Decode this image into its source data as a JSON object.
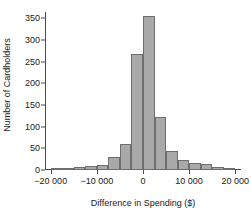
{
  "chart_data": {
    "type": "bar",
    "title": "",
    "xlabel": "Difference in Spending ($)",
    "ylabel": "Number of Cardholders",
    "grid": false,
    "legend": false,
    "xlim": [
      -21250,
      21250
    ],
    "ylim": [
      0,
      365
    ],
    "bin_width": 2500,
    "xticks": [
      -20000,
      -10000,
      0,
      10000,
      20000
    ],
    "xtick_labels": [
      "−20 000",
      "−10 000",
      "0",
      "10 000",
      "20 000"
    ],
    "yticks": [
      0,
      50,
      100,
      150,
      200,
      250,
      300,
      350
    ],
    "ytick_labels": [
      "0",
      "50",
      "100",
      "150",
      "200",
      "250",
      "300",
      "350"
    ],
    "categories": [
      "-20000 to -17500",
      "-17500 to -15000",
      "-15000 to -12500",
      "-12500 to -10000",
      "-10000 to -7500",
      "-7500 to -5000",
      "-5000 to -2500",
      "-2500 to 0",
      "0 to 2500",
      "2500 to 5000",
      "5000 to 7500",
      "7500 to 10000",
      "10000 to 12500",
      "12500 to 15000",
      "15000 to 17500",
      "17500 to 20000"
    ],
    "bin_starts": [
      -20000,
      -17500,
      -15000,
      -12500,
      -10000,
      -7500,
      -5000,
      -2500,
      0,
      2500,
      5000,
      7500,
      10000,
      12500,
      15000,
      17500
    ],
    "values": [
      2,
      3,
      8,
      10,
      11,
      29,
      59,
      268,
      355,
      122,
      43,
      24,
      17,
      13,
      8,
      5
    ],
    "series": [
      {
        "name": "Number of Cardholders",
        "values": [
          2,
          3,
          8,
          10,
          11,
          29,
          59,
          268,
          355,
          122,
          43,
          24,
          17,
          13,
          8,
          5
        ]
      }
    ],
    "colors": {
      "bar_fill": "#a9a9a9",
      "bar_edge": "#6e6e6e",
      "axis": "#4a4a4a",
      "text": "#1a1a1a",
      "background": "#ffffff"
    }
  }
}
